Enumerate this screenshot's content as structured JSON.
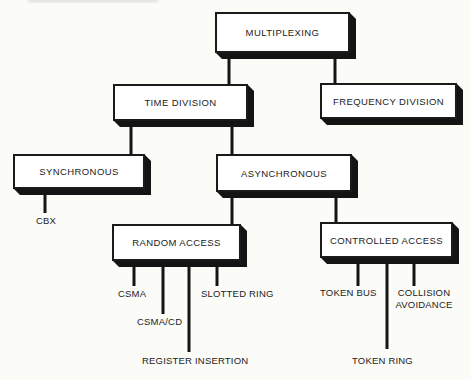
{
  "diagram": {
    "type": "tree",
    "colors": {
      "background": "#fbfbf8",
      "box_fill": "#ffffff",
      "box_border": "#1a1a1a",
      "shadow": "#141414",
      "line": "#141414",
      "text": "#222222"
    },
    "nodes": {
      "multiplexing": "MULTIPLEXING",
      "time_division": "TIME DIVISION",
      "frequency_division": "FREQUENCY DIVISION",
      "synchronous": "SYNCHRONOUS",
      "asynchronous": "ASYNCHRONOUS",
      "random_access": "RANDOM ACCESS",
      "controlled_access": "CONTROLLED ACCESS",
      "cbx": "CBX",
      "csma": "CSMA",
      "csma_cd": "CSMA/CD",
      "slotted_ring": "SLOTTED RING",
      "register_insertion": "REGISTER INSERTION",
      "token_bus": "TOKEN BUS",
      "collision_avoidance": "COLLISION AVOIDANCE",
      "token_ring": "TOKEN RING"
    },
    "hierarchy": {
      "MULTIPLEXING": {
        "TIME DIVISION": {
          "SYNCHRONOUS": [
            "CBX"
          ],
          "ASYNCHRONOUS": {
            "RANDOM ACCESS": [
              "CSMA",
              "CSMA/CD",
              "REGISTER INSERTION",
              "SLOTTED RING"
            ],
            "CONTROLLED ACCESS": [
              "TOKEN BUS",
              "TOKEN RING",
              "COLLISION AVOIDANCE"
            ]
          }
        },
        "FREQUENCY DIVISION": {}
      }
    }
  }
}
